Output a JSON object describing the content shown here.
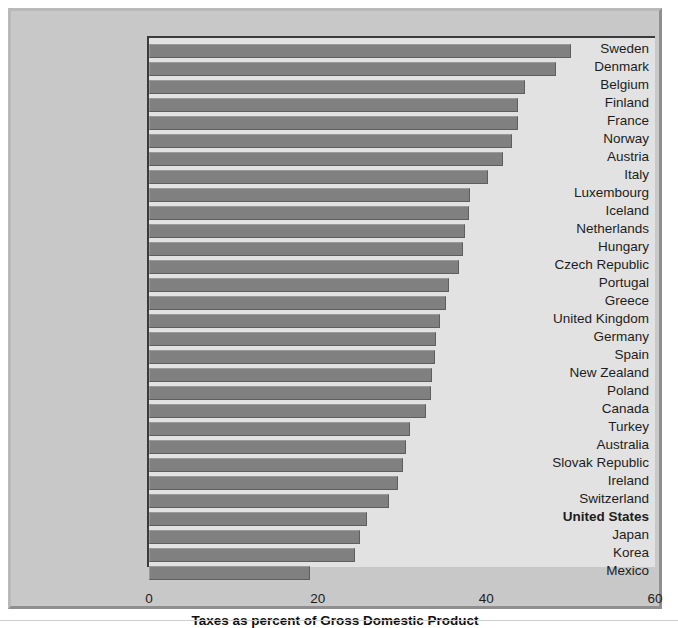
{
  "chart_data": {
    "type": "bar",
    "orientation": "horizontal",
    "title": "",
    "xlabel": "Taxes as percent of Gross Domestic Product",
    "ylabel": "",
    "xlim": [
      0,
      60
    ],
    "xticks": [
      0,
      20,
      40,
      60
    ],
    "xtick_labels": [
      "0",
      "20",
      "40",
      "60"
    ],
    "grid": false,
    "legend": null,
    "highlight_category": "United States",
    "bar_color": "#808080",
    "plot_background": "#e2e2e2",
    "figure_background": "#c8c8c8",
    "categories": [
      "Sweden",
      "Denmark",
      "Belgium",
      "Finland",
      "France",
      "Norway",
      "Austria",
      "Italy",
      "Luxembourg",
      "Iceland",
      "Netherlands",
      "Hungary",
      "Czech Republic",
      "Portugal",
      "Greece",
      "United Kingdom",
      "Germany",
      "Spain",
      "New Zealand",
      "Poland",
      "Canada",
      "Turkey",
      "Australia",
      "Slovak Republic",
      "Ireland",
      "Switzerland",
      "United States",
      "Japan",
      "Korea",
      "Mexico"
    ],
    "values": [
      50.0,
      48.3,
      44.6,
      43.8,
      43.7,
      43.1,
      42.0,
      40.2,
      38.1,
      37.9,
      37.5,
      37.2,
      36.8,
      35.6,
      35.2,
      34.5,
      34.0,
      33.9,
      33.6,
      33.4,
      32.8,
      31.0,
      30.5,
      30.1,
      29.5,
      28.5,
      25.8,
      25.0,
      24.4,
      19.1
    ]
  },
  "axis": {
    "xlabel": "Taxes as percent of Gross Domestic Product",
    "tick_0": "0",
    "tick_20": "20",
    "tick_40": "40",
    "tick_60": "60"
  }
}
